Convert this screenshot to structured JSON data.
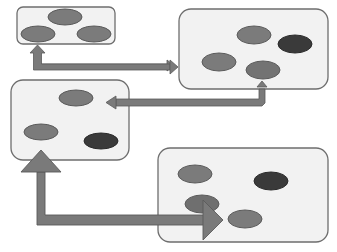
{
  "diagram": {
    "colors": {
      "background": "#ffffff",
      "box_fill": "#f2f2f2",
      "box_stroke": "#6e6e6e",
      "ellipse_medium": "#7b7b7b",
      "ellipse_dark": "#3a3a3a",
      "ellipse_stroke": "#5a5a5a",
      "arrow_fill": "#7a7a7a",
      "arrow_stroke": "#5a5a5a"
    },
    "boxes": [
      {
        "id": "box-top-left",
        "x": 17,
        "y": 7,
        "w": 98,
        "h": 37,
        "ellipses": [
          {
            "cx": 65,
            "cy": 17,
            "rx": 17,
            "ry": 8,
            "tone": "medium"
          },
          {
            "cx": 38,
            "cy": 34,
            "rx": 17,
            "ry": 8,
            "tone": "medium"
          },
          {
            "cx": 94,
            "cy": 34,
            "rx": 17,
            "ry": 8,
            "tone": "medium"
          }
        ]
      },
      {
        "id": "box-top-right",
        "x": 179,
        "y": 9,
        "w": 149,
        "h": 80,
        "ellipses": [
          {
            "cx": 254,
            "cy": 35,
            "rx": 17,
            "ry": 9,
            "tone": "medium"
          },
          {
            "cx": 295,
            "cy": 44,
            "rx": 17,
            "ry": 9,
            "tone": "dark"
          },
          {
            "cx": 219,
            "cy": 62,
            "rx": 17,
            "ry": 9,
            "tone": "medium"
          },
          {
            "cx": 263,
            "cy": 70,
            "rx": 17,
            "ry": 9,
            "tone": "medium"
          }
        ]
      },
      {
        "id": "box-middle-left",
        "x": 11,
        "y": 80,
        "w": 118,
        "h": 80,
        "ellipses": [
          {
            "cx": 76,
            "cy": 98,
            "rx": 17,
            "ry": 8,
            "tone": "medium"
          },
          {
            "cx": 41,
            "cy": 132,
            "rx": 17,
            "ry": 8,
            "tone": "medium"
          },
          {
            "cx": 101,
            "cy": 141,
            "rx": 17,
            "ry": 8,
            "tone": "dark"
          }
        ]
      },
      {
        "id": "box-bottom-right",
        "x": 158,
        "y": 148,
        "w": 170,
        "h": 94,
        "ellipses": [
          {
            "cx": 195,
            "cy": 174,
            "rx": 17,
            "ry": 9,
            "tone": "medium"
          },
          {
            "cx": 271,
            "cy": 181,
            "rx": 17,
            "ry": 9,
            "tone": "dark"
          },
          {
            "cx": 202,
            "cy": 204,
            "rx": 17,
            "ry": 9,
            "tone": "medium"
          },
          {
            "cx": 245,
            "cy": 219,
            "rx": 17,
            "ry": 9,
            "tone": "medium"
          }
        ]
      }
    ],
    "arrows": [
      {
        "id": "arrow-topleft-topright",
        "type": "bidirectional-elbow",
        "from": "box-top-left",
        "to": "box-top-right"
      },
      {
        "id": "arrow-topright-middleleft",
        "type": "elbow",
        "from": "box-top-right",
        "to": "box-middle-left"
      },
      {
        "id": "arrow-middleleft-bottomright",
        "type": "bidirectional-elbow",
        "from": "box-middle-left",
        "to": "box-bottom-right"
      }
    ]
  }
}
